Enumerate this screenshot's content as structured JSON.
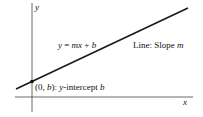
{
  "diagram": {
    "axes": {
      "x_label": "x",
      "y_label": "y"
    },
    "line": {
      "equation_parts": [
        "y",
        " = ",
        "mx",
        " + ",
        "b"
      ],
      "slope_label_prefix": "Line: Slope ",
      "slope_symbol": "m"
    },
    "intercept": {
      "point_open": "(0, ",
      "point_b": "b",
      "point_close": "): ",
      "desc_y": "y",
      "desc_text": "-intercept ",
      "desc_b": "b"
    },
    "colors": {
      "line": "#1a1a1a",
      "axis": "#444444",
      "text": "#111111"
    }
  }
}
